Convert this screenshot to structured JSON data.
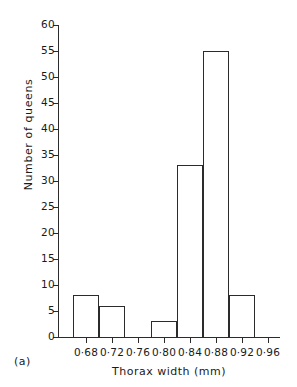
{
  "panel": {
    "label": "(a)"
  },
  "chart_data": {
    "type": "bar",
    "title": "",
    "subtitle": "",
    "xlabel": "Thorax width  (mm)",
    "ylabel": "Number of queens",
    "categories": [
      "0·68",
      "0·72",
      "0·76",
      "0·80",
      "0·84",
      "0·88",
      "0·92",
      "0·96"
    ],
    "values": [
      8,
      6,
      0,
      3,
      33,
      55,
      8,
      0
    ],
    "xlim": [
      0.66,
      0.98
    ],
    "ylim": [
      0,
      60
    ],
    "yticks": [
      0,
      5,
      10,
      15,
      20,
      25,
      30,
      35,
      40,
      45,
      50,
      55,
      60
    ],
    "ytick_labels": [
      "0",
      "5",
      "10",
      "15",
      "20",
      "25",
      "30",
      "35",
      "40",
      "45",
      "50",
      "55",
      "60"
    ],
    "grid": false,
    "legend": "none",
    "bar_style": "outline",
    "bar_edge_color": "#2b2b2b",
    "bar_fill_color": "transparent",
    "axis_color": "#2b2b2b",
    "background_color": "#ffffff",
    "bin_width": 0.04,
    "bars_centered_on_ticks": true
  }
}
